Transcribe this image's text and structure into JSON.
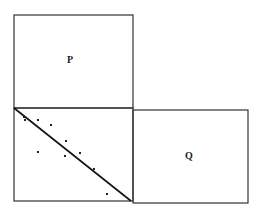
{
  "diagram": {
    "boxes": [
      {
        "id": "P",
        "label": "P",
        "x": 14,
        "y": 15,
        "w": 119,
        "h": 93
      },
      {
        "id": "scatter",
        "label": "",
        "x": 14,
        "y": 108,
        "w": 119,
        "h": 93
      },
      {
        "id": "Q",
        "label": "Q",
        "x": 133,
        "y": 110,
        "w": 115,
        "h": 93
      }
    ],
    "line": {
      "x1": 14,
      "y1": 108,
      "x2": 131,
      "y2": 201
    },
    "points": [
      {
        "x": 24,
        "y": 117
      },
      {
        "x": 25,
        "y": 120
      },
      {
        "x": 38,
        "y": 120
      },
      {
        "x": 51,
        "y": 125
      },
      {
        "x": 66,
        "y": 141
      },
      {
        "x": 38,
        "y": 152
      },
      {
        "x": 65,
        "y": 156
      },
      {
        "x": 80,
        "y": 153
      },
      {
        "x": 94,
        "y": 169
      },
      {
        "x": 107,
        "y": 194
      }
    ],
    "stroke_color": "#333333"
  }
}
